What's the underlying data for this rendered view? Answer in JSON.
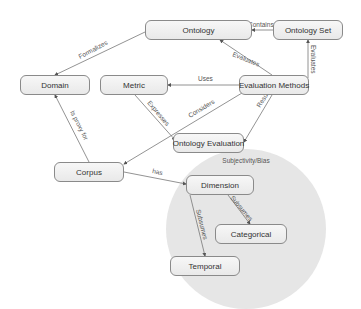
{
  "diagram": {
    "group": {
      "label": "Subjectivity/Bias",
      "cx": 246,
      "cy": 229,
      "r": 80,
      "fill": "#e6e6e6"
    },
    "nodes": [
      {
        "id": "ontology",
        "label": "Ontology",
        "x": 145,
        "y": 20,
        "w": 107,
        "h": 20
      },
      {
        "id": "ontology-set",
        "label": "Ontology Set",
        "x": 273,
        "y": 20,
        "w": 70,
        "h": 20
      },
      {
        "id": "domain",
        "label": "Domain",
        "x": 20,
        "y": 75,
        "w": 70,
        "h": 20
      },
      {
        "id": "metric",
        "label": "Metric",
        "x": 100,
        "y": 75,
        "w": 68,
        "h": 20
      },
      {
        "id": "evaluation-methods",
        "label": "Evaluation Methods",
        "x": 239,
        "y": 75,
        "w": 70,
        "h": 20
      },
      {
        "id": "ontology-evaluation",
        "label": "Ontology Evaluation",
        "x": 173,
        "y": 133,
        "w": 71,
        "h": 20
      },
      {
        "id": "corpus",
        "label": "Corpus",
        "x": 54,
        "y": 162,
        "w": 70,
        "h": 20
      },
      {
        "id": "dimension",
        "label": "Dimension",
        "x": 186,
        "y": 175,
        "w": 68,
        "h": 20
      },
      {
        "id": "categorical",
        "label": "Categorical",
        "x": 215,
        "y": 224,
        "w": 72,
        "h": 20
      },
      {
        "id": "temporal",
        "label": "Temporal",
        "x": 170,
        "y": 256,
        "w": 70,
        "h": 20
      }
    ],
    "edges": [
      {
        "from": "ontology-set",
        "to": "ontology",
        "label": "Contains",
        "x1": 273,
        "y1": 30,
        "x2": 252,
        "y2": 30,
        "lx": 248,
        "ly": 27,
        "rot": 0
      },
      {
        "from": "evaluation-methods",
        "to": "ontology",
        "label": "Evaluates",
        "x1": 272,
        "y1": 75,
        "x2": 220,
        "y2": 40,
        "lx": 232,
        "ly": 56,
        "rot": 22
      },
      {
        "from": "evaluation-methods",
        "to": "ontology-set",
        "label": "Evaluates",
        "x1": 308,
        "y1": 78,
        "x2": 308,
        "y2": 40,
        "lx": 311,
        "ly": 45,
        "rot": 90
      },
      {
        "from": "ontology",
        "to": "domain",
        "label": "Formalizes",
        "x1": 145,
        "y1": 32,
        "x2": 55,
        "y2": 75,
        "lx": 80,
        "ly": 59,
        "rot": -28
      },
      {
        "from": "evaluation-methods",
        "to": "metric",
        "label": "Uses",
        "x1": 239,
        "y1": 85,
        "x2": 168,
        "y2": 85,
        "lx": 198,
        "ly": 81,
        "rot": 0
      },
      {
        "from": "metric",
        "to": "ontology-evaluation",
        "label": "Expresses",
        "x1": 135,
        "y1": 95,
        "x2": 175,
        "y2": 140,
        "lx": 147,
        "ly": 103,
        "rot": 50
      },
      {
        "from": "evaluation-methods",
        "to": "corpus",
        "label": "Considers",
        "x1": 242,
        "y1": 93,
        "x2": 124,
        "y2": 164,
        "lx": 190,
        "ly": 118,
        "rot": -31
      },
      {
        "from": "evaluation-methods",
        "to": "ontology-evaluation",
        "label": "Results",
        "x1": 272,
        "y1": 95,
        "x2": 244,
        "y2": 142,
        "lx": 260,
        "ly": 108,
        "rot": -58
      },
      {
        "from": "corpus",
        "to": "domain",
        "label": "Is proxy for",
        "x1": 89,
        "y1": 162,
        "x2": 55,
        "y2": 95,
        "lx": 70,
        "ly": 112,
        "rot": 63
      },
      {
        "from": "corpus",
        "to": "dimension",
        "label": "has",
        "x1": 124,
        "y1": 172,
        "x2": 186,
        "y2": 184,
        "lx": 152,
        "ly": 173,
        "rot": 11
      },
      {
        "from": "dimension",
        "to": "temporal",
        "label": "Subsumes",
        "x1": 190,
        "y1": 195,
        "x2": 205,
        "y2": 256,
        "lx": 196,
        "ly": 210,
        "rot": 76
      },
      {
        "from": "dimension",
        "to": "categorical",
        "label": "Subsumes",
        "x1": 228,
        "y1": 195,
        "x2": 250,
        "y2": 224,
        "lx": 230,
        "ly": 198,
        "rot": 50
      }
    ],
    "colors": {
      "edge": "#777777",
      "node_border": "#8a8a8a",
      "text": "#333333"
    }
  }
}
